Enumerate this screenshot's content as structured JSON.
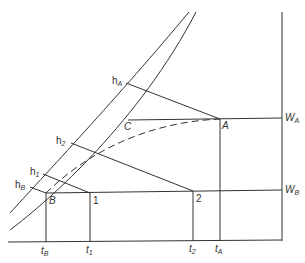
{
  "diagram": {
    "type": "psychrometric-mixing-diagram",
    "axes": {
      "x_axis": "temperature",
      "y_axis": "humidity ratio (right side)"
    },
    "points": {
      "A": {
        "label": "A"
      },
      "B": {
        "label": "B"
      },
      "C": {
        "label": "C"
      },
      "p1": {
        "label": "1"
      },
      "p2": {
        "label": "2"
      }
    },
    "enthalpy_labels": {
      "hA": {
        "main": "h",
        "sub": "A"
      },
      "h2": {
        "main": "h",
        "sub": "2"
      },
      "h1": {
        "main": "h",
        "sub": "1"
      },
      "hB": {
        "main": "h",
        "sub": "B"
      }
    },
    "humidity_labels": {
      "WA": {
        "main": "W",
        "sub": "A"
      },
      "WB": {
        "main": "W",
        "sub": "B"
      }
    },
    "temperature_labels": {
      "tB": {
        "main": "t",
        "sub": "B"
      },
      "t1": {
        "main": "t",
        "sub": "1"
      },
      "t2": {
        "main": "t",
        "sub": "2"
      },
      "tA": {
        "main": "t",
        "sub": "A"
      }
    },
    "colors": {
      "line": "#333333",
      "background": "#ffffff"
    }
  }
}
